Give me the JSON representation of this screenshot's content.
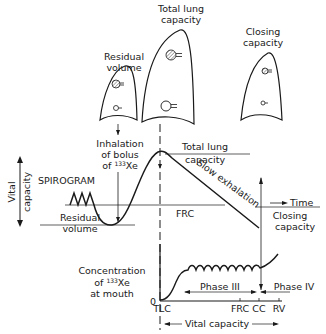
{
  "lungs": [
    {
      "id": "residual-volume",
      "label_lines": [
        "Residual",
        "volume"
      ]
    },
    {
      "id": "total-lung-capacity",
      "label_lines": [
        "Total lung",
        "capacity"
      ]
    },
    {
      "id": "closing-capacity",
      "label_lines": [
        "Closing",
        "capacity"
      ]
    }
  ],
  "spirogram": {
    "title": "SPIROGRAM",
    "vital_capacity_axis": [
      "Vital",
      "capacity"
    ],
    "inhalation_label": [
      "Inhalation",
      "of bolus",
      "of",
      "133",
      "Xe"
    ],
    "levels": {
      "total_lung_capacity": [
        "Total lung",
        "capacity"
      ],
      "frc": "FRC",
      "residual_volume": [
        "Residual",
        "volume"
      ],
      "closing_capacity": [
        "Closing",
        "capacity"
      ]
    },
    "slow_exhalation": "Slow exhalation",
    "time_label": "Time"
  },
  "concentration": {
    "ylabel_lines": [
      "Concentration",
      "of",
      "133",
      "Xe",
      "at mouth"
    ],
    "zero": "0",
    "x_ticks": [
      "TLC",
      "FRC",
      "CC",
      "RV"
    ],
    "phase3": "Phase III",
    "phase4": "Phase IV",
    "xlabel": "Vital capacity"
  }
}
